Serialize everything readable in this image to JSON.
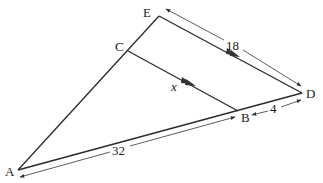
{
  "figure": {
    "type": "similar-triangles",
    "points": {
      "A": {
        "label": "A",
        "x": 18,
        "y": 170
      },
      "B": {
        "label": "B",
        "x": 238,
        "y": 111
      },
      "C": {
        "label": "C",
        "x": 128,
        "y": 51
      },
      "D": {
        "label": "D",
        "x": 302,
        "y": 93
      },
      "E": {
        "label": "E",
        "x": 159,
        "y": 16
      }
    },
    "segments": [
      {
        "from": "A",
        "to": "E"
      },
      {
        "from": "E",
        "to": "D"
      },
      {
        "from": "A",
        "to": "D"
      },
      {
        "from": "C",
        "to": "B"
      }
    ],
    "parallel_marks": [
      "CB",
      "ED"
    ],
    "measurements": {
      "ED": "18",
      "CB": "x",
      "BD": "4",
      "AB": "32"
    }
  }
}
